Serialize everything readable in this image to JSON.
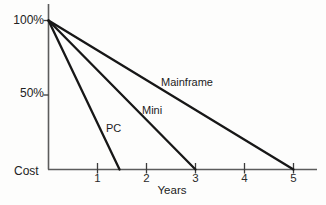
{
  "figure": {
    "background_color": "#fdfdfc",
    "line_color": "#171717",
    "axis_color": "#5c5c5c",
    "text_color": "#222222"
  },
  "chart_data": {
    "type": "line",
    "title": "",
    "xlabel": "Years",
    "ylabel": "Cost",
    "xlim": [
      0,
      5.45
    ],
    "ylim": [
      0,
      100
    ],
    "grid": false,
    "legend": "inline labels beside each line",
    "x_ticks": [
      1,
      2,
      3,
      4,
      5
    ],
    "y_ticks": [
      {
        "value": 100,
        "label": "100%"
      },
      {
        "value": 50,
        "label": "50%"
      }
    ],
    "series": [
      {
        "name": "PC",
        "points": [
          {
            "x": 0,
            "y": 100
          },
          {
            "x": 1.45,
            "y": 0
          }
        ]
      },
      {
        "name": "Mini",
        "points": [
          {
            "x": 0,
            "y": 100
          },
          {
            "x": 3,
            "y": 0
          }
        ]
      },
      {
        "name": "Mainframe",
        "points": [
          {
            "x": 0,
            "y": 100
          },
          {
            "x": 5,
            "y": 0
          }
        ]
      }
    ]
  }
}
